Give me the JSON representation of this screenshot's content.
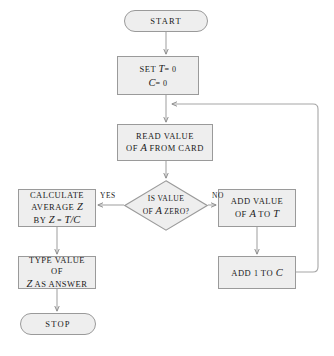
{
  "diagram": {
    "fill_color": "#eeeeee",
    "stroke_color": "#9a9a9a",
    "text_color": "#1a1a1a",
    "background": "#ffffff",
    "canvas": {
      "width": 334,
      "height": 356
    }
  },
  "nodes": {
    "start": {
      "shape": "terminator",
      "label": "START"
    },
    "set": {
      "shape": "process",
      "line1_prefix": "SET ",
      "line1_var": "T",
      "line1_value": "= 0",
      "line2_var": "C",
      "line2_value": "= 0"
    },
    "read": {
      "shape": "process",
      "line1": "READ VALUE",
      "line2_prefix": "OF ",
      "line2_var": "A",
      "line2_suffix": " FROM CARD"
    },
    "decision": {
      "shape": "decision",
      "line1": "IS VALUE",
      "line2_prefix": "OF ",
      "line2_var": "A",
      "line2_suffix": " ZERO?"
    },
    "calculate": {
      "shape": "process",
      "line1": "CALCULATE",
      "line2_prefix": "AVERAGE ",
      "line2_var": "Z",
      "line3_prefix": "BY ",
      "line3_expr_z": "Z",
      "line3_eq": " = ",
      "line3_expr_t": "T",
      "line3_slash": "/",
      "line3_expr_c": "C"
    },
    "addvalue": {
      "shape": "process",
      "line1": "ADD VALUE",
      "line2_prefix": "OF ",
      "line2_var": "A",
      "line2_mid": " TO ",
      "line2_var2": "T"
    },
    "type": {
      "shape": "process",
      "line1": "TYPE VALUE OF",
      "line2_var": "Z",
      "line2_suffix": " AS ANSWER"
    },
    "addone": {
      "shape": "process",
      "line1_prefix": "ADD ",
      "line1_num": "1",
      "line1_mid": " TO ",
      "line1_var": "C"
    },
    "stop": {
      "shape": "terminator",
      "label": "STOP"
    }
  },
  "edge_labels": {
    "yes": "YES",
    "no": "NO"
  },
  "edges": [
    {
      "from": "start",
      "to": "set",
      "label": ""
    },
    {
      "from": "set",
      "to": "read",
      "label": ""
    },
    {
      "from": "read",
      "to": "decision",
      "label": ""
    },
    {
      "from": "decision",
      "to": "calculate",
      "label": "YES"
    },
    {
      "from": "decision",
      "to": "addvalue",
      "label": "NO"
    },
    {
      "from": "calculate",
      "to": "type",
      "label": ""
    },
    {
      "from": "type",
      "to": "stop",
      "label": ""
    },
    {
      "from": "addvalue",
      "to": "addone",
      "label": ""
    },
    {
      "from": "addone",
      "to": "read",
      "label": ""
    }
  ]
}
